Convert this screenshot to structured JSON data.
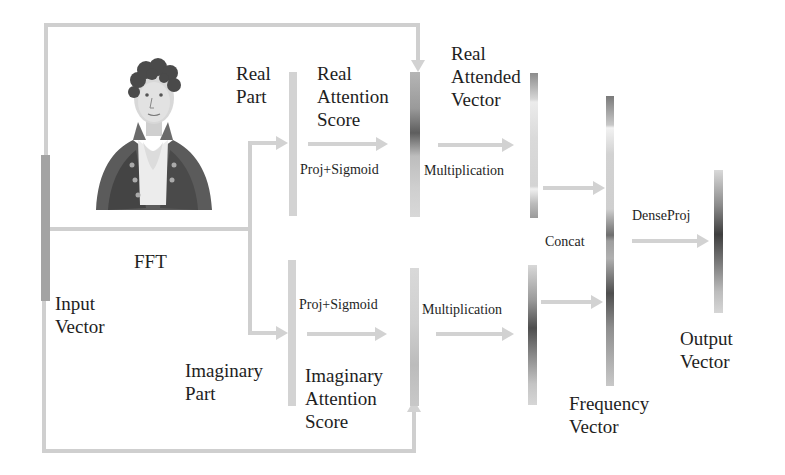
{
  "diagram": {
    "type": "flowchart",
    "nodes": {
      "input_vector": "Input\nVector",
      "fft": "FFT",
      "real_part": "Real\nPart",
      "imaginary_part": "Imaginary\nPart",
      "real_attention_score": "Real\nAttention\nScore",
      "imaginary_attention_score": "Imaginary\nAttention\nScore",
      "real_attended_vector": "Real\nAttended\nVector",
      "frequency_vector": "Frequency\nVector",
      "output_vector": "Output\nVector"
    },
    "operations": {
      "proj_sigmoid_real": "Proj+Sigmoid",
      "proj_sigmoid_imag": "Proj+Sigmoid",
      "multiplication_real": "Multiplication",
      "multiplication_imag": "Multiplication",
      "concat": "Concat",
      "dense_proj": "DenseProj"
    },
    "edges": [
      {
        "from": "Input Vector",
        "to": "Real Part",
        "label": "FFT"
      },
      {
        "from": "Input Vector",
        "to": "Imaginary Part",
        "label": "FFT"
      },
      {
        "from": "Real Part",
        "to": "Real Attention Score",
        "label": "Proj+Sigmoid"
      },
      {
        "from": "Imaginary Part",
        "to": "Imaginary Attention Score",
        "label": "Proj+Sigmoid"
      },
      {
        "from": "Input Vector",
        "to": "Real Attention Score",
        "label": "skip (top loop)"
      },
      {
        "from": "Input Vector",
        "to": "Imaginary Attention Score",
        "label": "skip (bottom loop)"
      },
      {
        "from": "Real Attention Score",
        "to": "Real Attended Vector",
        "label": "Multiplication"
      },
      {
        "from": "Imaginary Attention Score",
        "to": "Imaginary Attended Vector",
        "label": "Multiplication"
      },
      {
        "from": "Real Attended Vector",
        "to": "Frequency Vector",
        "label": "Concat"
      },
      {
        "from": "Imaginary Attended Vector",
        "to": "Frequency Vector",
        "label": "Concat"
      },
      {
        "from": "Frequency Vector",
        "to": "Output Vector",
        "label": "DenseProj"
      }
    ],
    "portrait": "engraved portrait of Joseph Fourier",
    "colors": {
      "connector": "#d0d0d0",
      "vector_light": "#d4d4d4",
      "vector_dark": "#5a5a5a",
      "text": "#1e1e1e"
    }
  }
}
